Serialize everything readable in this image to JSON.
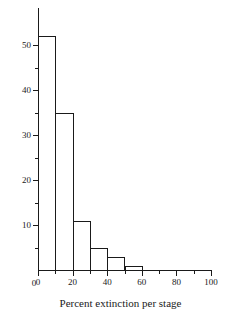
{
  "chart_data": {
    "type": "bar",
    "title": "",
    "subtitle": "",
    "xlabel": "Percent extinction per stage",
    "ylabel": "Number of geologic stages",
    "categories": [
      "0-10",
      "10-20",
      "20-30",
      "30-40",
      "40-50",
      "50-60"
    ],
    "bin_edges": [
      0,
      10,
      20,
      30,
      40,
      50,
      60
    ],
    "bin_width": 10,
    "values": [
      52,
      35,
      11,
      5,
      3,
      1
    ],
    "xlim": [
      0,
      100
    ],
    "ylim": [
      0,
      58
    ],
    "x_major_ticks": [
      0,
      20,
      40,
      60,
      80,
      100
    ],
    "x_minor_ticks": [
      10,
      30,
      50,
      70,
      90
    ],
    "x_tick_labels": [
      "0",
      "20",
      "40",
      "60",
      "80",
      "100"
    ],
    "y_major_ticks": [
      0,
      10,
      20,
      30,
      40,
      50
    ],
    "y_minor_ticks": [
      5,
      15,
      25,
      35,
      45
    ],
    "y_tick_labels": [
      "0",
      "10",
      "20",
      "30",
      "40",
      "50"
    ],
    "grid": false,
    "legend": false,
    "legend_position": "none",
    "bar_fill": "none",
    "bar_edge_color": "#1a1a1a",
    "axis_color": "#1a1a1a",
    "background": "#ffffff"
  }
}
